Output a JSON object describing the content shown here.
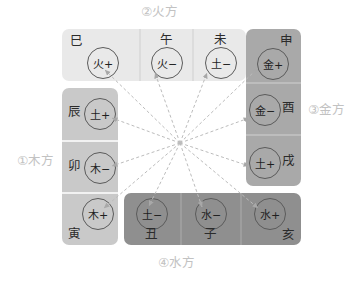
{
  "diagram": {
    "title_visible": false,
    "hub": {
      "x": 180,
      "y": 143,
      "rays": 12
    }
  },
  "group_labels": [
    {
      "name": "fire",
      "text": "②火方",
      "position": "top"
    },
    {
      "name": "metal",
      "text": "③金方",
      "position": "right"
    },
    {
      "name": "wood",
      "text": "①木方",
      "position": "left"
    },
    {
      "name": "water",
      "text": "④水方",
      "position": "bottom"
    }
  ],
  "colors": {
    "fire_block": "#e9e9e9",
    "wood_block": "#c9c9c9",
    "metal_block": "#a9a9a9",
    "water_block": "#8f8f8f",
    "label_text": "#c2c2c2",
    "circle_stroke": "#5b5b5b",
    "arrow_stroke": "#b9b9b9",
    "branch_text": "#2b2b2b"
  },
  "cells": [
    {
      "id": "si",
      "branch": "巳",
      "element": "火+",
      "group": "fire",
      "branch_pos": "top-left"
    },
    {
      "id": "wu",
      "branch": "午",
      "element": "火−",
      "group": "fire",
      "branch_pos": "top-center"
    },
    {
      "id": "wei",
      "branch": "未",
      "element": "土−",
      "group": "fire",
      "branch_pos": "top-center"
    },
    {
      "id": "shen",
      "branch": "申",
      "element": "金+",
      "group": "metal",
      "branch_pos": "top-right"
    },
    {
      "id": "you",
      "branch": "酉",
      "element": "金−",
      "group": "metal",
      "branch_pos": "right-mid"
    },
    {
      "id": "xu",
      "branch": "戌",
      "element": "土+",
      "group": "metal",
      "branch_pos": "right-mid"
    },
    {
      "id": "hai",
      "branch": "亥",
      "element": "水+",
      "group": "water",
      "branch_pos": "bottom-right"
    },
    {
      "id": "zi",
      "branch": "子",
      "element": "水−",
      "group": "water",
      "branch_pos": "bottom-center"
    },
    {
      "id": "chou",
      "branch": "丑",
      "element": "土−",
      "group": "water",
      "branch_pos": "bottom-center"
    },
    {
      "id": "yin",
      "branch": "寅",
      "element": "木+",
      "group": "wood",
      "branch_pos": "bottom-left"
    },
    {
      "id": "mao",
      "branch": "卯",
      "element": "木−",
      "group": "wood",
      "branch_pos": "left-mid"
    },
    {
      "id": "chen",
      "branch": "辰",
      "element": "土+",
      "group": "wood",
      "branch_pos": "left-mid"
    }
  ]
}
